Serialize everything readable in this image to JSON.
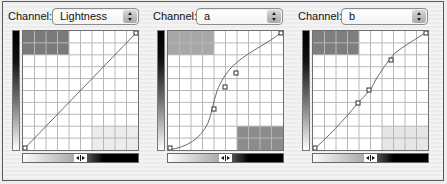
{
  "panels": [
    {
      "channel_label": "Channel:",
      "channel_value": "Lightness",
      "top_left_shade": "#7a7a7a",
      "bottom_right_shade": "#ececec",
      "curve_points": [
        [
          0,
          0
        ],
        [
          1,
          1
        ]
      ],
      "curve_path": "M0,119 L115,0",
      "control_points": []
    },
    {
      "channel_label": "Channel:",
      "channel_value": "a",
      "top_left_shade": "#a8a8a8",
      "bottom_right_shade": "#8c8c8c",
      "curve_points": [
        [
          0,
          0
        ],
        [
          0.4,
          0.4
        ],
        [
          0.5,
          0.6
        ],
        [
          0.6,
          0.7
        ],
        [
          1,
          1
        ]
      ],
      "curve_path": "M0,119 C25,115 35,105 45,80 C50,65 55,48 60,40 C68,28 80,20 95,14 C102,10 110,5 115,0",
      "control_points": [
        [
          46,
          79
        ],
        [
          58,
          52
        ],
        [
          70,
          38
        ]
      ]
    },
    {
      "channel_label": "Channel:",
      "channel_value": "b",
      "top_left_shade": "#7e7e7e",
      "bottom_right_shade": "#e6e6e6",
      "curve_points": [
        [
          0,
          0
        ],
        [
          0.4,
          0.4
        ],
        [
          0.5,
          0.5
        ],
        [
          0.7,
          0.7
        ],
        [
          1,
          1
        ]
      ],
      "curve_path": "M0,119 C20,100 35,80 45,72 C55,62 65,55 75,38 C82,28 95,20 115,0",
      "control_points": [
        [
          45,
          72
        ],
        [
          56,
          59
        ],
        [
          78,
          32
        ]
      ]
    }
  ]
}
